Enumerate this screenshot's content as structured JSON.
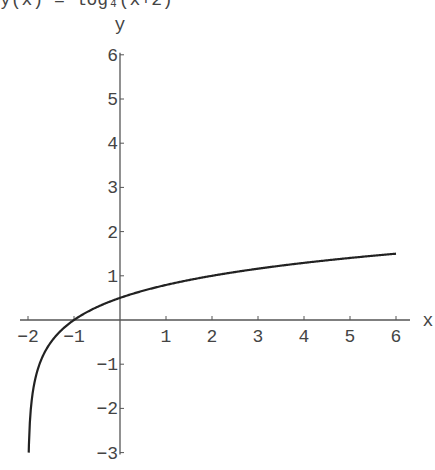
{
  "header": {
    "cut_off_text": "y(x) = log₄(x+2)"
  },
  "chart_data": {
    "type": "line",
    "title": "",
    "xlabel": "x",
    "ylabel": "y",
    "xlim": [
      -2,
      6
    ],
    "ylim": [
      -3,
      6
    ],
    "x_ticks": [
      -2,
      -1,
      1,
      2,
      3,
      4,
      5,
      6
    ],
    "y_ticks": [
      -3,
      -2,
      -1,
      1,
      2,
      3,
      4,
      5,
      6
    ],
    "grid": false,
    "legend": null,
    "series": [
      {
        "name": "y = log4(x+2)",
        "function": "log4(x+2)",
        "x": [
          -1.999,
          -1.9,
          -1.75,
          -1.5,
          -1,
          0,
          1,
          2,
          3,
          4,
          5,
          6
        ],
        "y": [
          -3.0,
          -1.66,
          -1.0,
          -0.5,
          0,
          0.5,
          0.79,
          1.0,
          1.16,
          1.29,
          1.4,
          1.5
        ]
      }
    ],
    "colors": {
      "curve": "#222222",
      "axes": "#555555"
    }
  }
}
